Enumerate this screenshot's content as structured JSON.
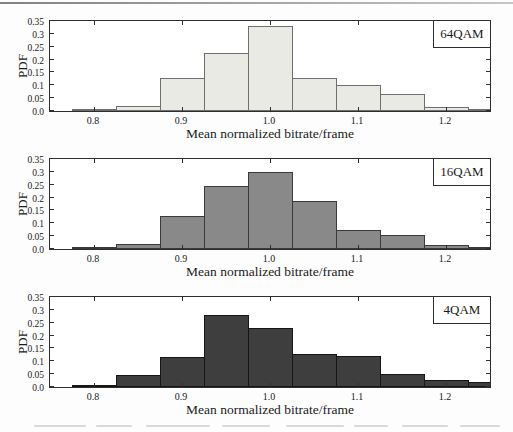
{
  "chart_data": [
    {
      "type": "bar",
      "variant": "histogram",
      "legend": "64QAM",
      "xlabel": "Mean normalized bitrate/frame",
      "ylabel": "PDF",
      "xlim": [
        0.75,
        1.25
      ],
      "ylim": [
        0,
        0.35
      ],
      "x_ticks": [
        0.8,
        0.9,
        1.0,
        1.1,
        1.2
      ],
      "x_tick_labels": [
        "0.8",
        "0.9",
        "1.0",
        "1.1",
        "1.2"
      ],
      "y_ticks": [
        0,
        0.05,
        0.1,
        0.15,
        0.2,
        0.25,
        0.3,
        0.35
      ],
      "y_tick_labels": [
        "0.0",
        "0.05",
        "0.1",
        "0.15",
        "0.2",
        "0.25",
        "0.3",
        "0.35"
      ],
      "bin_start": 0.775,
      "bin_width": 0.05,
      "bin_centers": [
        0.8,
        0.85,
        0.9,
        0.95,
        1.0,
        1.05,
        1.1,
        1.15,
        1.2,
        1.25
      ],
      "values": [
        0.005,
        0.018,
        0.13,
        0.225,
        0.33,
        0.13,
        0.1,
        0.065,
        0.015,
        0.005
      ],
      "bar_fill": "#eaeae5",
      "bar_stroke": "#6f6f6f",
      "grid": false,
      "legend_position": "top-right"
    },
    {
      "type": "bar",
      "variant": "histogram",
      "legend": "16QAM",
      "xlabel": "Mean normalized bitrate/frame",
      "ylabel": "PDF",
      "xlim": [
        0.75,
        1.25
      ],
      "ylim": [
        0,
        0.35
      ],
      "x_ticks": [
        0.8,
        0.9,
        1.0,
        1.1,
        1.2
      ],
      "x_tick_labels": [
        "0.8",
        "0.9",
        "1.0",
        "1.1",
        "1.2"
      ],
      "y_ticks": [
        0,
        0.05,
        0.1,
        0.15,
        0.2,
        0.25,
        0.3,
        0.35
      ],
      "y_tick_labels": [
        "0.0",
        "0.05",
        "0.1",
        "0.15",
        "0.2",
        "0.25",
        "0.3",
        "0.35"
      ],
      "bin_start": 0.775,
      "bin_width": 0.05,
      "bin_centers": [
        0.8,
        0.85,
        0.9,
        0.95,
        1.0,
        1.05,
        1.1,
        1.15,
        1.2,
        1.25
      ],
      "values": [
        0.005,
        0.018,
        0.13,
        0.245,
        0.3,
        0.185,
        0.075,
        0.055,
        0.015,
        0.008
      ],
      "bar_fill": "#898989",
      "bar_stroke": "#3a3a3a",
      "grid": false,
      "legend_position": "top-right"
    },
    {
      "type": "bar",
      "variant": "histogram",
      "legend": "4QAM",
      "xlabel": "Mean normalized bitrate/frame",
      "ylabel": "PDF",
      "xlim": [
        0.75,
        1.25
      ],
      "ylim": [
        0,
        0.35
      ],
      "x_ticks": [
        0.8,
        0.9,
        1.0,
        1.1,
        1.2
      ],
      "x_tick_labels": [
        "0.8",
        "0.9",
        "1.0",
        "1.1",
        "1.2"
      ],
      "y_ticks": [
        0,
        0.05,
        0.1,
        0.15,
        0.2,
        0.25,
        0.3,
        0.35
      ],
      "y_tick_labels": [
        "0.0",
        "0.05",
        "0.1",
        "0.15",
        "0.2",
        "0.25",
        "0.3",
        "0.35"
      ],
      "bin_start": 0.775,
      "bin_width": 0.05,
      "bin_centers": [
        0.8,
        0.85,
        0.9,
        0.95,
        1.0,
        1.05,
        1.1,
        1.15,
        1.2,
        1.25
      ],
      "values": [
        0.005,
        0.045,
        0.115,
        0.28,
        0.23,
        0.13,
        0.12,
        0.05,
        0.028,
        0.018
      ],
      "bar_fill": "#3e3e3e",
      "bar_stroke": "#161616",
      "grid": false,
      "legend_position": "top-right"
    }
  ],
  "colors": {
    "axis": "#2e2e2e",
    "background": "#ffffff",
    "top_rule": "#8a8a8a"
  }
}
